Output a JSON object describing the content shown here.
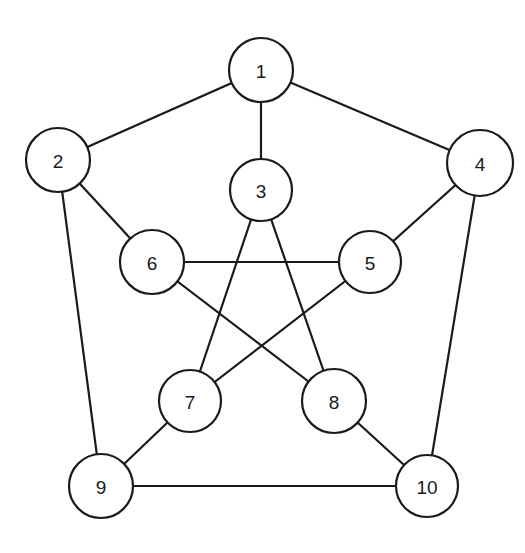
{
  "graph": {
    "type": "undirected",
    "style": {
      "stroke": "#1a1a1a",
      "fill": "#ffffff",
      "background": "#ffffff"
    },
    "nodes": [
      {
        "id": "1",
        "label": "1",
        "x": 261,
        "y": 70,
        "r": 32
      },
      {
        "id": "2",
        "label": "2",
        "x": 58,
        "y": 160,
        "r": 32
      },
      {
        "id": "3",
        "label": "3",
        "x": 261,
        "y": 190,
        "r": 31
      },
      {
        "id": "4",
        "label": "4",
        "x": 480,
        "y": 163,
        "r": 33
      },
      {
        "id": "5",
        "label": "5",
        "x": 370,
        "y": 262,
        "r": 31
      },
      {
        "id": "6",
        "label": "6",
        "x": 152,
        "y": 262,
        "r": 32
      },
      {
        "id": "7",
        "label": "7",
        "x": 190,
        "y": 401,
        "r": 31
      },
      {
        "id": "8",
        "label": "8",
        "x": 334,
        "y": 401,
        "r": 32
      },
      {
        "id": "9",
        "label": "9",
        "x": 101,
        "y": 486,
        "r": 32
      },
      {
        "id": "10",
        "label": "10",
        "x": 427,
        "y": 486,
        "r": 31
      }
    ],
    "edges": [
      [
        "1",
        "2"
      ],
      [
        "1",
        "3"
      ],
      [
        "1",
        "4"
      ],
      [
        "2",
        "6"
      ],
      [
        "2",
        "9"
      ],
      [
        "4",
        "5"
      ],
      [
        "4",
        "10"
      ],
      [
        "3",
        "7"
      ],
      [
        "3",
        "8"
      ],
      [
        "6",
        "5"
      ],
      [
        "6",
        "8"
      ],
      [
        "5",
        "7"
      ],
      [
        "7",
        "9"
      ],
      [
        "8",
        "10"
      ],
      [
        "9",
        "10"
      ]
    ]
  }
}
